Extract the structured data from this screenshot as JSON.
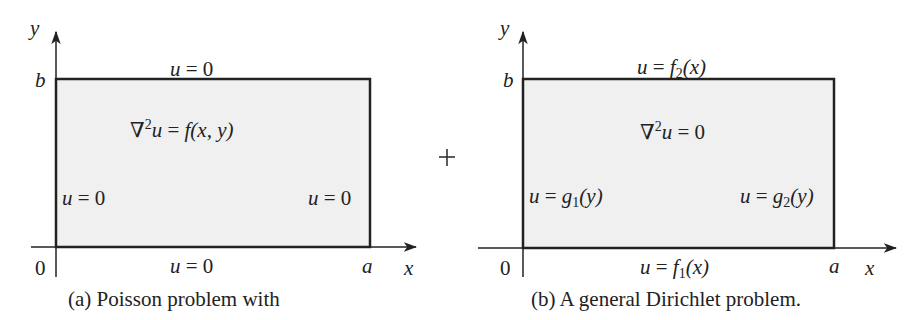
{
  "panel_a": {
    "axis_y": "y",
    "axis_x": "x",
    "tick_b": "b",
    "tick_a": "a",
    "origin": "0",
    "top_bc": {
      "u": "u",
      "eq": " = 0"
    },
    "bottom_bc": {
      "u": "u",
      "eq": " = 0"
    },
    "left_bc": {
      "u": "u",
      "eq": " = 0"
    },
    "right_bc": {
      "u": "u",
      "eq": " = 0"
    },
    "pde": {
      "nabla": "∇",
      "sup": "2",
      "u": "u",
      "eq": " = ",
      "rhs": "f(x, y)"
    },
    "caption": "(a)  Poisson problem with"
  },
  "operator": "+",
  "panel_b": {
    "axis_y": "y",
    "axis_x": "x",
    "tick_b": "b",
    "tick_a": "a",
    "origin": "0",
    "top_bc": {
      "u": "u",
      "eq": " = ",
      "f": "f",
      "sub": "2",
      "arg": "(x)"
    },
    "bottom_bc": {
      "u": "u",
      "eq": " = ",
      "f": "f",
      "sub": "1",
      "arg": "(x)"
    },
    "left_bc": {
      "u": "u",
      "eq": " = ",
      "f": "g",
      "sub": "1",
      "arg": "(y)"
    },
    "right_bc": {
      "u": "u",
      "eq": " = ",
      "f": "g",
      "sub": "2",
      "arg": "(y)"
    },
    "pde": {
      "nabla": "∇",
      "sup": "2",
      "u": "u",
      "eq": " = 0"
    },
    "caption": "(b)  A general Dirichlet problem."
  },
  "colors": {
    "fill": "#f0f0f0",
    "stroke": "#222222"
  }
}
